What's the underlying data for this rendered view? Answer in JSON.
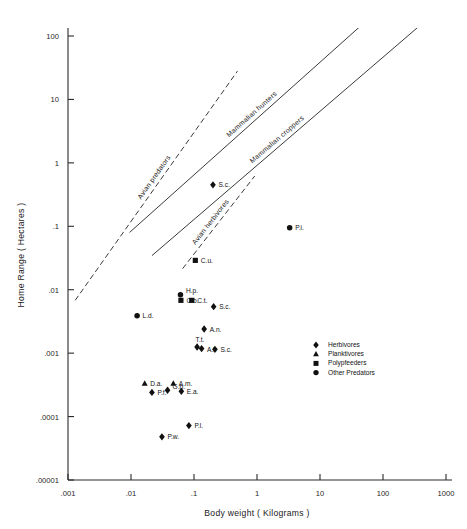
{
  "chart_data": {
    "type": "scatter",
    "title": "",
    "xlabel": "Body weight ( Kilograms )",
    "ylabel": "Home Range  ( Hectares )",
    "xscale": "log",
    "yscale": "log",
    "xlim": [
      0.001,
      1000
    ],
    "ylim": [
      1e-05,
      100
    ],
    "grid": false,
    "xticks": [
      0.001,
      0.01,
      0.1,
      1,
      10,
      100,
      1000
    ],
    "xticklabels": [
      ".001",
      ".01",
      ".1",
      "1",
      "10",
      "100",
      "1000"
    ],
    "yticks": [
      1e-05,
      0.0001,
      0.001,
      0.01,
      0.1,
      1,
      10,
      100
    ],
    "yticklabels": [
      ".00001",
      ".0001",
      ".001",
      ".01",
      ".1",
      "1",
      "10",
      "100"
    ],
    "legend_position": "lower-right",
    "legend": [
      {
        "label": "Herbivores",
        "marker": "diamond"
      },
      {
        "label": "Planktivores",
        "marker": "triangle"
      },
      {
        "label": "Polypfeeders",
        "marker": "square"
      },
      {
        "label": "Other Predators",
        "marker": "circle"
      }
    ],
    "points": [
      {
        "label": "S.c.",
        "marker": "diamond",
        "x": 0.2,
        "y": 0.45
      },
      {
        "label": "P.i.",
        "marker": "circle",
        "x": 3.3,
        "y": 0.095
      },
      {
        "label": "C.u.",
        "marker": "square",
        "x": 0.105,
        "y": 0.029
      },
      {
        "label": "H.p.",
        "marker": "circle",
        "x": 0.061,
        "y": 0.0083
      },
      {
        "label": "C.b.",
        "marker": "square",
        "x": 0.062,
        "y": 0.0068
      },
      {
        "label": "C.t.",
        "marker": "square",
        "x": 0.092,
        "y": 0.0068
      },
      {
        "label": "S.c.",
        "marker": "diamond",
        "x": 0.205,
        "y": 0.0054
      },
      {
        "label": "L.d.",
        "marker": "circle",
        "x": 0.0125,
        "y": 0.0039
      },
      {
        "label": "A.n.",
        "marker": "diamond",
        "x": 0.145,
        "y": 0.0024
      },
      {
        "label": "T.t.",
        "marker": "diamond",
        "x": 0.112,
        "y": 0.00125
      },
      {
        "label": "A.l.",
        "marker": "diamond",
        "x": 0.132,
        "y": 0.00118
      },
      {
        "label": "S.c.",
        "marker": "diamond",
        "x": 0.215,
        "y": 0.00115
      },
      {
        "label": "D.a.",
        "marker": "triangle",
        "x": 0.0165,
        "y": 0.00033
      },
      {
        "label": "A.m.",
        "marker": "triangle",
        "x": 0.047,
        "y": 0.00033
      },
      {
        "label": "P.f.",
        "marker": "diamond",
        "x": 0.0215,
        "y": 0.00024
      },
      {
        "label": "G.b.",
        "marker": "diamond",
        "x": 0.038,
        "y": 0.00026
      },
      {
        "label": "E.a.",
        "marker": "diamond",
        "x": 0.063,
        "y": 0.00025
      },
      {
        "label": "P.l.",
        "marker": "diamond",
        "x": 0.083,
        "y": 7.2e-05
      },
      {
        "label": "P.w.",
        "marker": "diamond",
        "x": 0.031,
        "y": 4.8e-05
      }
    ],
    "lines": [
      {
        "label": "Avian predators",
        "style": "dashed",
        "x0": 0.0013,
        "y0": 0.0068,
        "x1": 0.49,
        "y1": 28.0
      },
      {
        "label": "Mammalian hunters",
        "style": "solid",
        "x0": 0.0095,
        "y0": 0.08,
        "x1": 1000,
        "y1": 2300
      },
      {
        "label": "Mammalian croppers",
        "style": "solid",
        "x0": 0.0215,
        "y0": 0.0345,
        "x1": 1000,
        "y1": 330
      },
      {
        "label": "Avian herbivores",
        "style": "dashed",
        "x0": 0.066,
        "y0": 0.0215,
        "x1": 0.92,
        "y1": 0.62
      }
    ]
  }
}
